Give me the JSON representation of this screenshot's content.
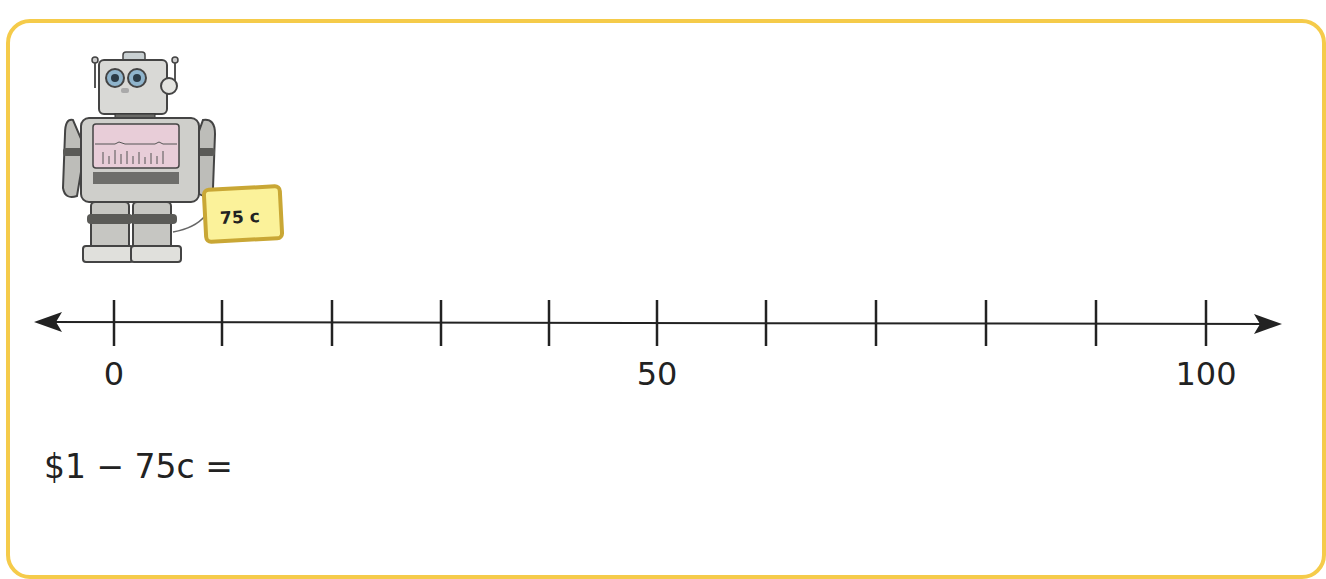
{
  "card": {
    "border_color": "#f5cb4a"
  },
  "robot": {
    "price_sign": "75 c",
    "sign_color": "#fbf29a",
    "sign_border": "#c9a735"
  },
  "number_line": {
    "min": 0,
    "max": 100,
    "tick_count": 11,
    "tick_step": 10,
    "labels": [
      {
        "value": 0,
        "text": "0"
      },
      {
        "value": 50,
        "text": "50"
      },
      {
        "value": 100,
        "text": "100"
      }
    ]
  },
  "question": {
    "equation": "$1 − 75c ="
  }
}
